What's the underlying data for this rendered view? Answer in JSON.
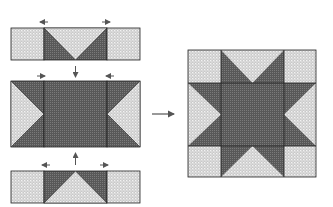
{
  "diagram": {
    "colors": {
      "background": "#ffffff",
      "light_fabric": "#c9c9c9",
      "light_fabric_dots": "#f2f2f2",
      "dark_fabric": "#585858",
      "dark_fabric_grid": "#7a7a7a",
      "outline": "#222222",
      "arrow": "#555555"
    },
    "steps": [
      {
        "id": "top-row",
        "label": "Top row: square, flying-geese unit, square",
        "pressing": [
          "left",
          "right"
        ],
        "joins": "down"
      },
      {
        "id": "middle-row",
        "label": "Middle row: flying-geese unit, center square, flying-geese unit",
        "pressing": [
          "right",
          "left"
        ]
      },
      {
        "id": "bottom-row",
        "label": "Bottom row: square, flying-geese unit, square",
        "pressing": [
          "left",
          "right"
        ],
        "joins": "up"
      }
    ],
    "result": {
      "label": "Finished star block"
    },
    "arrow": {
      "direction": "right"
    }
  }
}
